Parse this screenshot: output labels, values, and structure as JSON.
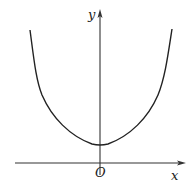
{
  "figure": {
    "type": "function-graph",
    "labels": {
      "y_axis": "y",
      "x_axis": "x",
      "origin": "O"
    },
    "colors": {
      "stroke": "#222222",
      "background": "#ffffff"
    }
  }
}
